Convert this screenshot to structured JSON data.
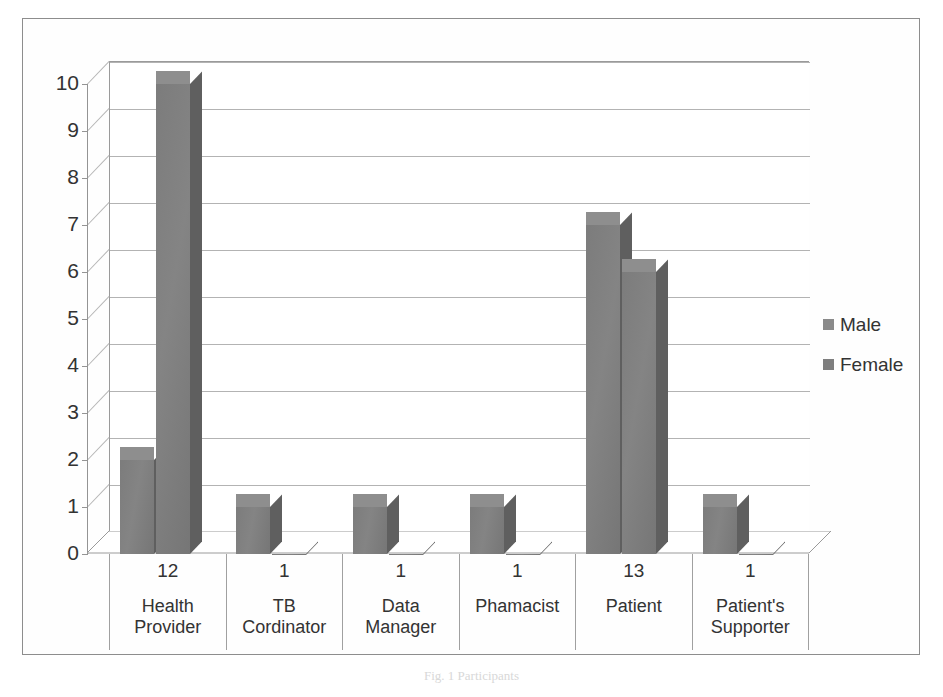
{
  "figure": {
    "caption": "Fig. 1 Participants"
  },
  "chart_data": {
    "type": "bar",
    "title": "",
    "xlabel": "",
    "ylabel": "",
    "categories": [
      "Health Provider",
      "TB Cordinator",
      "Data Manager",
      "Phamacist",
      "Patient",
      "Patient's Supporter"
    ],
    "category_counts": [
      "12",
      "1",
      "1",
      "1",
      "13",
      "1"
    ],
    "series": [
      {
        "name": "Male",
        "values": [
          2,
          1,
          1,
          1,
          7,
          1
        ],
        "color": "#8a8a8a"
      },
      {
        "name": "Female",
        "values": [
          10,
          0,
          0,
          0,
          6,
          0
        ],
        "color": "#7e7e7e"
      }
    ],
    "ylim": [
      0,
      10
    ],
    "yticks": [
      "0",
      "1",
      "2",
      "3",
      "4",
      "5",
      "6",
      "7",
      "8",
      "9",
      "10"
    ],
    "grid": true,
    "legend_position": "right",
    "style": "3d-clustered-column"
  },
  "legend": {
    "items": [
      {
        "label": "Male"
      },
      {
        "label": "Female"
      }
    ]
  },
  "axis": {
    "y_labels": [
      "10",
      "9",
      "8",
      "7",
      "6",
      "5",
      "4",
      "3",
      "2",
      "1",
      "0"
    ]
  },
  "colors": {
    "bar_front": "#7c7c7c",
    "bar_side": "#5f5f5f",
    "bar_top": "#8e8e8e",
    "grid": "#b3b3b3",
    "frame": "#8d8d8d",
    "text": "#333333"
  }
}
